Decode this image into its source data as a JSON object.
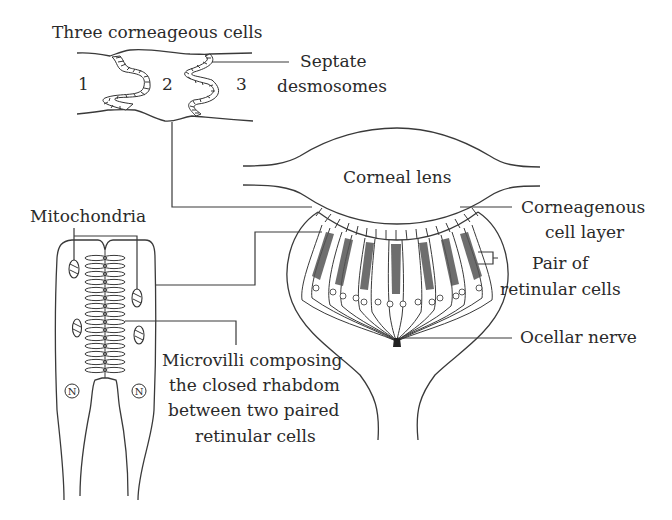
{
  "figure": {
    "labels": {
      "three_cells": "Three corneageous cells",
      "cell_1": "1",
      "cell_2": "2",
      "cell_3": "3",
      "septate_line1": "Septate",
      "septate_line2": "desmosomes",
      "corneal_lens": "Corneal lens",
      "corneagenous_line1": "Corneagenous",
      "corneagenous_line2": "cell layer",
      "mitochondria": "Mitochondria",
      "pair_line1": "Pair of",
      "pair_line2": "retinular cells",
      "ocellar_nerve": "Ocellar nerve",
      "microvilli_line1": "Microvilli composing",
      "microvilli_line2": "the closed rhabdom",
      "microvilli_line3": "between two paired",
      "microvilli_line4": "retinular cells",
      "nucleus_left": "N",
      "nucleus_right": "N"
    }
  }
}
